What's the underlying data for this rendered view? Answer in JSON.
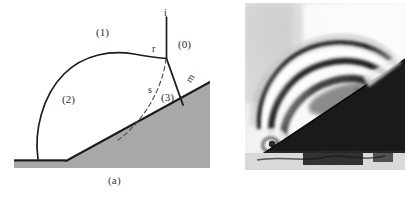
{
  "figure": {
    "panels": [
      {
        "id": "a",
        "caption": "(a)",
        "kind": "schematic-diagram",
        "description": "Schematic of a double-Mach / Mach reflection of a shock wave over an inclined wedge"
      },
      {
        "id": "b",
        "caption": "(b)",
        "kind": "schlieren-photograph",
        "description": "Schlieren photograph of the corresponding shock reflection over a wedge"
      }
    ]
  },
  "diagram": {
    "regions": [
      {
        "key": "r1",
        "label": "(1)",
        "meaning": "region behind incident shock"
      },
      {
        "key": "r2",
        "label": "(2)",
        "meaning": "region behind Mach stem"
      },
      {
        "key": "r3",
        "label": "(3)",
        "meaning": "region behind reflected shock"
      },
      {
        "key": "r0",
        "label": "(0)",
        "meaning": "undisturbed region ahead of incident shock"
      }
    ],
    "waves": [
      {
        "key": "i",
        "label": "i",
        "meaning": "incident shock"
      },
      {
        "key": "r",
        "label": "r",
        "meaning": "reflected shock"
      },
      {
        "key": "s",
        "label": "s",
        "meaning": "slipstream / shear layer"
      },
      {
        "key": "m",
        "label": "m",
        "meaning": "Mach stem"
      }
    ]
  },
  "colors": {
    "wedge_fill": "#a8a8a8",
    "wedge_outline": "#1c1c1c",
    "shock_line": "#1c1c1c",
    "slipstream_line": "#4a4a4a",
    "text": "#2b2b2b",
    "photo_dark_wedge": "#1a1a1a",
    "photo_background": "#e9e9e9",
    "page_background": "#ffffff"
  }
}
